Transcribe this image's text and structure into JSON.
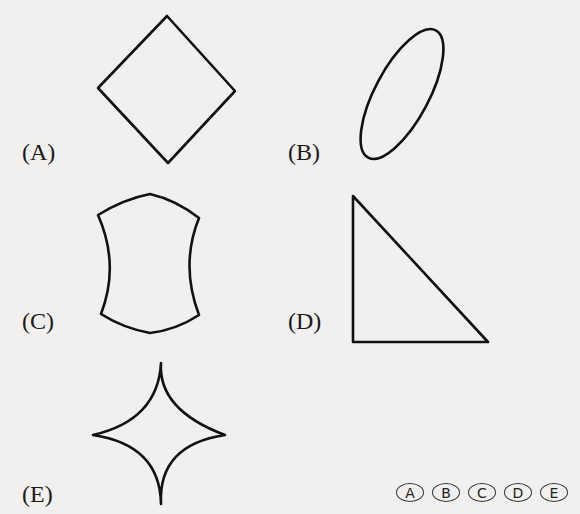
{
  "question": {
    "figures": [
      {
        "label": "(A)",
        "shape": "diamond"
      },
      {
        "label": "(B)",
        "shape": "ellipse"
      },
      {
        "label": "(C)",
        "shape": "concave-hexagon"
      },
      {
        "label": "(D)",
        "shape": "right-triangle"
      },
      {
        "label": "(E)",
        "shape": "four-pointed-star"
      }
    ]
  },
  "answer_bubbles": [
    "A",
    "B",
    "C",
    "D",
    "E"
  ],
  "colors": {
    "background": "#f1f0ee",
    "stroke": "#111111"
  }
}
